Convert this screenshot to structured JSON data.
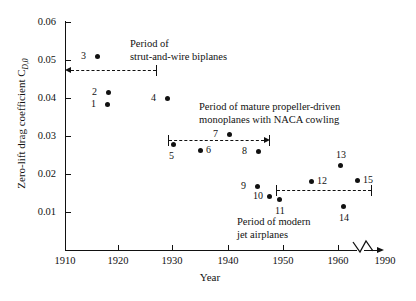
{
  "chart_data": {
    "type": "scatter",
    "title": "",
    "xlabel": "Year",
    "ylabel": "Zero-lift drag coefficient C",
    "ylabel_sub": "D,0",
    "xlim": [
      1910,
      1990
    ],
    "ylim": [
      0,
      0.06
    ],
    "grid": false,
    "legend": "none",
    "xticks": [
      {
        "value": 1910,
        "label": "1910",
        "px": 65
      },
      {
        "value": 1920,
        "label": "1920",
        "px": 118
      },
      {
        "value": 1930,
        "label": "1930",
        "px": 172
      },
      {
        "value": 1940,
        "label": "1940",
        "px": 228
      },
      {
        "value": 1950,
        "label": "1950",
        "px": 283
      },
      {
        "value": 1960,
        "label": "1960",
        "px": 338
      },
      {
        "value": 1990,
        "label": "1990",
        "px": 385
      }
    ],
    "yticks": [
      {
        "value": 0.06,
        "label": "0.06",
        "px": 22
      },
      {
        "value": 0.05,
        "label": "0.05",
        "px": 60
      },
      {
        "value": 0.04,
        "label": "0.04",
        "px": 98
      },
      {
        "value": 0.03,
        "label": "0.03",
        "px": 136
      },
      {
        "value": 0.02,
        "label": "0.02",
        "px": 174
      },
      {
        "value": 0.01,
        "label": "0.01",
        "px": 212
      }
    ],
    "axis_break": true,
    "points": [
      {
        "id": "1",
        "x": 1918,
        "y": 0.0375,
        "px": 107,
        "py": 104,
        "label_side": "left"
      },
      {
        "id": "2",
        "x": 1918,
        "y": 0.0415,
        "px": 108,
        "py": 92,
        "label_side": "left"
      },
      {
        "id": "3",
        "x": 1916,
        "y": 0.0505,
        "px": 97,
        "py": 56,
        "label_side": "left"
      },
      {
        "id": "4",
        "x": 1929,
        "y": 0.039,
        "px": 167,
        "py": 98,
        "label_side": "left"
      },
      {
        "id": "5",
        "x": 1930,
        "y": 0.0255,
        "px": 173,
        "py": 144,
        "label_side": "below"
      },
      {
        "id": "6",
        "x": 1935,
        "y": 0.024,
        "px": 200,
        "py": 150,
        "label_side": "right"
      },
      {
        "id": "7",
        "x": 1940,
        "y": 0.0295,
        "px": 229,
        "py": 134,
        "label_side": "left"
      },
      {
        "id": "8",
        "x": 1946,
        "y": 0.024,
        "px": 258,
        "py": 151,
        "label_side": "left"
      },
      {
        "id": "9",
        "x": 1945,
        "y": 0.017,
        "px": 257,
        "py": 186,
        "label_side": "left"
      },
      {
        "id": "10",
        "x": 1947,
        "y": 0.0145,
        "px": 269,
        "py": 196,
        "label_side": "left"
      },
      {
        "id": "11",
        "x": 1949,
        "y": 0.0135,
        "px": 279,
        "py": 199,
        "label_side": "below"
      },
      {
        "id": "12",
        "x": 1954,
        "y": 0.0183,
        "px": 311,
        "py": 181,
        "label_side": "right"
      },
      {
        "id": "13",
        "x": 1958,
        "y": 0.0225,
        "px": 340,
        "py": 165,
        "label_side": "above"
      },
      {
        "id": "14",
        "x": 1959,
        "y": 0.0118,
        "px": 343,
        "py": 206,
        "label_side": "below"
      },
      {
        "id": "15",
        "x": 1962,
        "y": 0.0185,
        "px": 357,
        "py": 180,
        "label_side": "right"
      }
    ],
    "annotations": [
      {
        "name": "strut-and-wire-biplanes",
        "lines": [
          "Period of",
          "strut-and-wire biplanes"
        ],
        "text_px": 130,
        "text_py": 38,
        "bracket": {
          "x1": 65,
          "x2": 157,
          "py": 70,
          "end_left": "arrow",
          "end_right": "bar"
        }
      },
      {
        "name": "mature-propeller-driven-monoplanes",
        "lines": [
          "Period of mature propeller-driven",
          "monoplanes with NACA cowling"
        ],
        "text_px": 199,
        "text_py": 101,
        "bracket": {
          "x1": 168,
          "x2": 270,
          "py": 140,
          "end_left": "bar",
          "end_right": "arrow"
        }
      },
      {
        "name": "modern-jet-airplanes",
        "lines": [
          "Period of modern",
          "jet airplanes"
        ],
        "text_px": 237,
        "text_py": 216,
        "bracket": {
          "x1": 276,
          "x2": 372,
          "py": 190,
          "end_left": "bar",
          "end_right": "bar"
        }
      }
    ]
  }
}
